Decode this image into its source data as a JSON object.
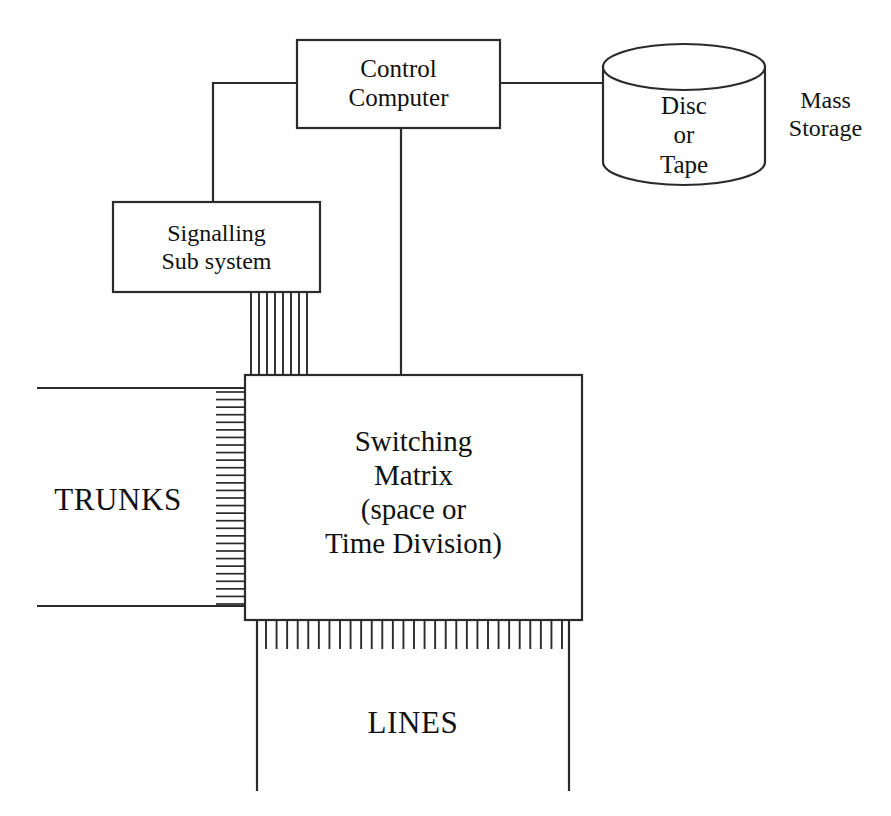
{
  "diagram": {
    "type": "block-diagram",
    "background_color": "#ffffff",
    "stroke_color": "#2b2b2b",
    "nodes": {
      "control_computer": {
        "label": "Control\nComputer",
        "shape": "rectangle"
      },
      "mass_storage_cylinder": {
        "label": "Disc\nor\nTape",
        "shape": "cylinder"
      },
      "mass_storage_caption": {
        "label": "Mass\nStorage"
      },
      "signalling_subsystem": {
        "label": "Signalling\nSub system",
        "shape": "rectangle"
      },
      "switching_matrix": {
        "label": "Switching\nMatrix\n(space or\nTime Division)",
        "shape": "rectangle"
      },
      "trunks": {
        "label": "TRUNKS"
      },
      "lines": {
        "label": "LINES"
      }
    },
    "connections": [
      {
        "name": "control-to-mass-storage",
        "from": "control_computer",
        "to": "mass_storage_cylinder",
        "style": "single-line"
      },
      {
        "name": "control-to-signalling",
        "from": "control_computer",
        "to": "signalling_subsystem",
        "style": "elbow-line"
      },
      {
        "name": "control-to-matrix",
        "from": "control_computer",
        "to": "switching_matrix",
        "style": "single-line"
      },
      {
        "name": "signalling-to-matrix",
        "from": "signalling_subsystem",
        "to": "switching_matrix",
        "style": "multi-line-bus",
        "line_count": 8
      },
      {
        "name": "trunks-to-matrix",
        "from": "trunks",
        "to": "switching_matrix",
        "style": "hatched-bus",
        "line_count": 29
      },
      {
        "name": "matrix-to-lines",
        "from": "switching_matrix",
        "to": "lines",
        "style": "tick-bus",
        "line_count": 29
      }
    ]
  }
}
